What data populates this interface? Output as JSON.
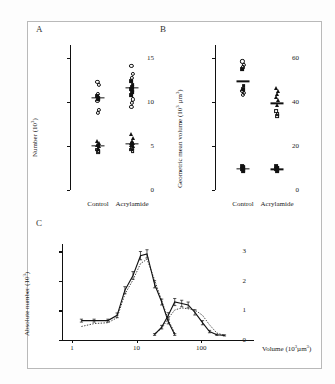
{
  "figure": {
    "panels": [
      {
        "letter": "A"
      },
      {
        "letter": "B"
      },
      {
        "letter": "C"
      }
    ]
  },
  "panelA": {
    "letter": "A",
    "ylabel": "Number (10",
    "ylabel_exp": "3",
    "ylabel_close": ")",
    "yticks": [
      "0",
      "5",
      "10",
      "15"
    ],
    "ylim": [
      0,
      16.5
    ],
    "categories": [
      "Control",
      "Acrylamide"
    ]
  },
  "panelB": {
    "letter": "B",
    "ylabel": "Geometric mean volume (10",
    "ylabel_exp": "3",
    "ylabel_mid": " µm",
    "ylabel_exp2": "3",
    "ylabel_close": ")",
    "yticks": [
      "0",
      "20",
      "40",
      "60"
    ],
    "ylim": [
      0,
      66
    ],
    "categories": [
      "Control",
      "Acrylamide"
    ]
  },
  "panelC": {
    "letter": "C",
    "ylabel": "Absolute number (10",
    "ylabel_exp": "3",
    "ylabel_close": ")",
    "yticks": [
      "0",
      "1",
      "2",
      "3"
    ],
    "xticks": [
      "1",
      "10",
      "100"
    ],
    "xlabel": "Volume (10",
    "xlabel_exp": "3",
    "xlabel_mid": "µm",
    "xlabel_exp2": "3",
    "xlabel_close": ")"
  },
  "chart_data": [
    {
      "type": "scatter",
      "panel": "A",
      "title": "",
      "ylabel": "Number (10^3)",
      "xlabel": "",
      "ylim": [
        0,
        16.5
      ],
      "yticks": [
        0,
        5,
        10,
        15
      ],
      "categories": [
        "Control",
        "Acrylamide"
      ],
      "grid": false,
      "legend": "none",
      "groups": [
        {
          "category": "Control",
          "cluster": "upper",
          "marker": "open-circle/filled-square",
          "mean": 10.5,
          "values": [
            12.3,
            12.0,
            10.9,
            10.7,
            10.5,
            10.3,
            10.1,
            9.1,
            8.8
          ]
        },
        {
          "category": "Control",
          "cluster": "lower",
          "marker": "filled-triangle/open-square",
          "mean": 5.05,
          "values": [
            5.6,
            5.4,
            5.2,
            5.1,
            5.0,
            4.8,
            4.6,
            4.4,
            4.3
          ]
        },
        {
          "category": "Acrylamide",
          "cluster": "upper",
          "marker": "open-circle/filled-square",
          "mean": 11.6,
          "values": [
            14.1,
            13.2,
            12.8,
            12.4,
            12.0,
            11.7,
            11.5,
            11.3,
            11.1,
            10.8,
            10.3,
            9.9,
            9.5
          ]
        },
        {
          "category": "Acrylamide",
          "cluster": "lower",
          "marker": "filled-triangle/open-square",
          "mean": 5.25,
          "values": [
            6.4,
            5.9,
            5.6,
            5.4,
            5.3,
            5.2,
            5.1,
            5.0,
            4.8,
            4.6,
            4.4
          ]
        }
      ]
    },
    {
      "type": "scatter",
      "panel": "B",
      "title": "",
      "ylabel": "Geometric mean volume (10^3 µm^3)",
      "xlabel": "",
      "ylim": [
        0,
        66
      ],
      "yticks": [
        0,
        20,
        40,
        60
      ],
      "categories": [
        "Control",
        "Acrylamide"
      ],
      "grid": false,
      "legend": "none",
      "groups": [
        {
          "category": "Control",
          "cluster": "upper",
          "marker": "open-circle/filled-square",
          "mean": 49.5,
          "values": [
            58.5,
            57.0,
            55.8,
            55.0,
            47.5,
            46.0,
            45.0,
            44.2,
            43.2
          ]
        },
        {
          "category": "Control",
          "cluster": "lower",
          "marker": "filled-square",
          "mean": 9.5,
          "values": [
            11.0,
            10.3,
            9.8,
            9.5,
            9.0,
            8.5
          ]
        },
        {
          "category": "Acrylamide",
          "cluster": "upper",
          "marker": "open-circle/filled-triangle",
          "mean": 39.5,
          "values": [
            46.5,
            45.0,
            43.5,
            42.2,
            41.0,
            38.5,
            36.0,
            34.5,
            33.5
          ]
        },
        {
          "category": "Acrylamide",
          "cluster": "lower",
          "marker": "filled-square",
          "mean": 9.4,
          "values": [
            10.8,
            10.2,
            9.8,
            9.4,
            9.0,
            8.4
          ]
        }
      ]
    },
    {
      "type": "line",
      "panel": "C",
      "title": "",
      "xlabel": "Volume (10^3 µm^3)",
      "ylabel": "Absolute number (10^3)",
      "xscale": "log",
      "xlim": [
        0.7,
        400
      ],
      "ylim": [
        0,
        3.25
      ],
      "yticks": [
        0,
        1,
        2,
        3
      ],
      "xticks": [
        1,
        10,
        100
      ],
      "grid": false,
      "legend": "none",
      "series": [
        {
          "name": "small-volume population (solid)",
          "style": "solid",
          "x": [
            1.4,
            2.2,
            3.6,
            5.0,
            6.6,
            8.8,
            11.5,
            14.5,
            19.0,
            24.5,
            31.0,
            39.0
          ],
          "y": [
            0.52,
            0.52,
            0.52,
            0.7,
            1.55,
            2.05,
            2.72,
            2.78,
            1.75,
            1.15,
            0.48,
            0.05
          ],
          "errors": [
            0.05,
            0.05,
            0.05,
            0.08,
            0.12,
            0.13,
            0.14,
            0.14,
            0.12,
            0.1,
            0.07,
            0.03
          ]
        },
        {
          "name": "small-volume population (dotted)",
          "style": "dotted",
          "x": [
            1.4,
            2.2,
            3.6,
            5.0,
            6.6,
            8.8,
            11.5,
            14.5,
            19.0,
            24.5,
            31.0,
            39.0
          ],
          "y": [
            0.32,
            0.42,
            0.45,
            0.62,
            1.42,
            1.9,
            2.45,
            2.6,
            1.9,
            1.2,
            0.55,
            0.1
          ],
          "errors": [
            0.05,
            0.05,
            0.05,
            0.08,
            0.12,
            0.13,
            0.14,
            0.14,
            0.12,
            0.1,
            0.07,
            0.03
          ]
        },
        {
          "name": "large-volume population (solid)",
          "style": "solid",
          "x": [
            19.0,
            24.5,
            31.0,
            39.0,
            50.0,
            63.0,
            80.0,
            105.0,
            135.0,
            175.0,
            230.0
          ],
          "y": [
            0.05,
            0.3,
            0.7,
            1.15,
            1.1,
            1.05,
            0.8,
            0.45,
            0.15,
            0.04,
            0.02
          ],
          "errors": [
            0.03,
            0.06,
            0.09,
            0.12,
            0.11,
            0.1,
            0.09,
            0.07,
            0.04,
            0.02,
            0.02
          ]
        },
        {
          "name": "large-volume population (dotted)",
          "style": "dotted",
          "x": [
            19.0,
            24.5,
            31.0,
            39.0,
            50.0,
            63.0,
            80.0,
            105.0,
            135.0,
            175.0,
            230.0
          ],
          "y": [
            0.08,
            0.25,
            0.6,
            0.88,
            0.95,
            0.92,
            0.88,
            0.7,
            0.38,
            0.1,
            0.02
          ],
          "errors": [
            0.03,
            0.06,
            0.09,
            0.12,
            0.11,
            0.1,
            0.09,
            0.07,
            0.04,
            0.02,
            0.02
          ]
        }
      ]
    }
  ]
}
